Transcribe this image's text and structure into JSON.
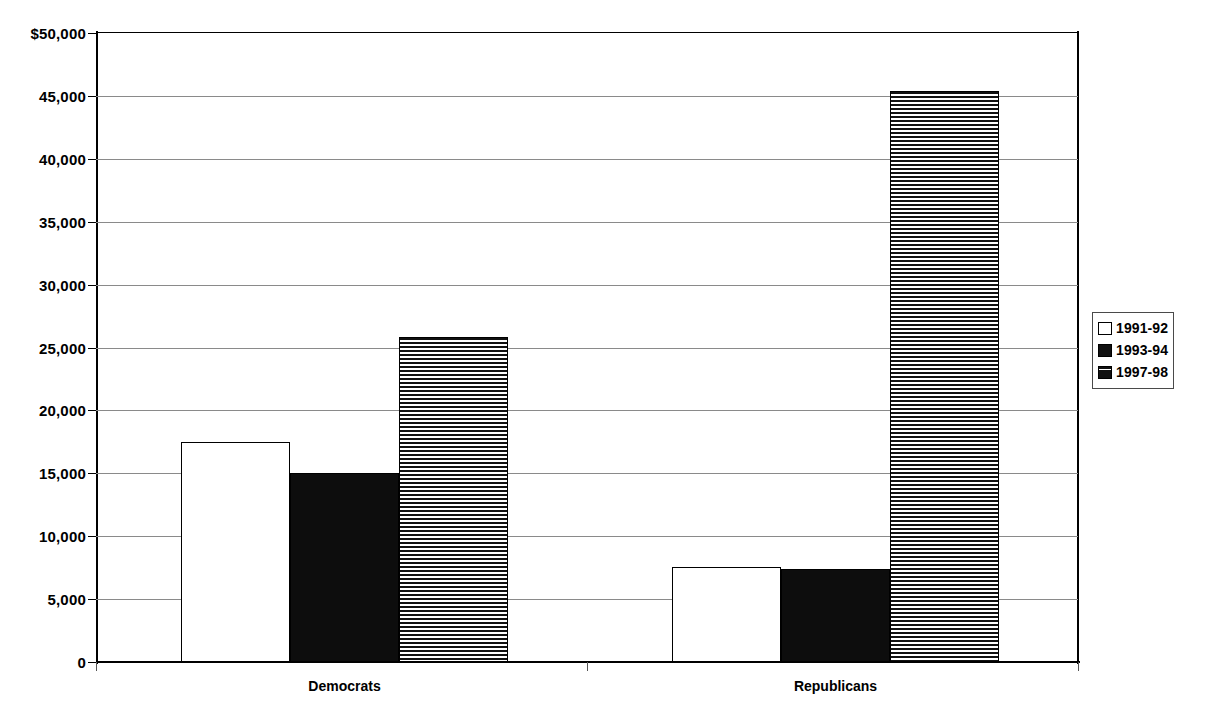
{
  "chart_data": {
    "type": "bar",
    "title": "",
    "xlabel": "",
    "ylabel": "",
    "ylim": [
      0,
      50000
    ],
    "grid": true,
    "legend_position": "right",
    "categories": [
      "Democrats",
      "Republicans"
    ],
    "ytick_labels": [
      "$50,000",
      "45,000",
      "40,000",
      "35,000",
      "30,000",
      "25,000",
      "20,000",
      "15,000",
      "10,000",
      "5,000",
      "0"
    ],
    "ytick_values": [
      50000,
      45000,
      40000,
      35000,
      30000,
      25000,
      20000,
      15000,
      10000,
      5000,
      0
    ],
    "series": [
      {
        "name": "1991-92",
        "fill": "white",
        "values": [
          17500,
          7550
        ]
      },
      {
        "name": "1993-94",
        "fill": "black",
        "values": [
          15000,
          7400
        ]
      },
      {
        "name": "1997-98",
        "fill": "stripe",
        "values": [
          25800,
          45400
        ]
      }
    ]
  },
  "legend": {
    "items": [
      {
        "label": "1991-92",
        "fill": "white"
      },
      {
        "label": "1993-94",
        "fill": "black"
      },
      {
        "label": "1997-98",
        "fill": "stripe"
      }
    ]
  },
  "colors": {
    "axis": "#000000",
    "grid": "#8a8a8a",
    "bar_white": "#ffffff",
    "bar_black": "#0d0d0d",
    "bar_stripe": "#111111",
    "background": "#ffffff"
  },
  "geometry": {
    "plot_left": 96,
    "plot_top": 33,
    "plot_width": 982,
    "plot_height": 629,
    "group_bar_width": 109,
    "group_starts": [
      85,
      576
    ]
  }
}
